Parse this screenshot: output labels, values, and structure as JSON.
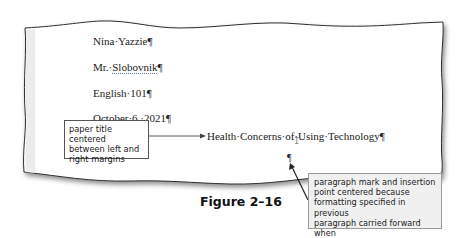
{
  "document": {
    "lines": [
      {
        "text": "Nina·Yazzie¶"
      },
      {
        "prefix": "Mr.·",
        "underlined": "Slobovnik",
        "suffix": "¶"
      },
      {
        "text": "English·101¶"
      },
      {
        "text": "October·6,·2021¶"
      }
    ],
    "title": "Health·Concerns·of·Using·Technology¶",
    "empty_paragraph_mark": "¶",
    "cursor_glyph": "I"
  },
  "callouts": {
    "left": {
      "lines": [
        "paper title centered",
        "between left and",
        "right margins"
      ]
    },
    "right": {
      "lines": [
        "paragraph mark and insertion",
        "point centered because",
        "formatting specified in previous",
        "paragraph carried forward when",
        "you pressed ENTER"
      ]
    }
  },
  "figure": {
    "label": "Figure 2–16"
  },
  "colors": {
    "page_border": "#333333",
    "margin_strip": "#ececec",
    "callout_right_fill": "#f0f0f0",
    "arrow": "#444444"
  }
}
